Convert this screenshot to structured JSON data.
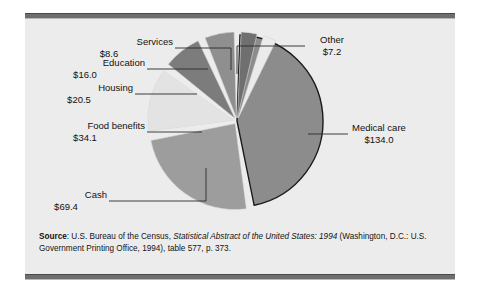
{
  "figure": {
    "background": "#ececec",
    "rule_color": "#6e6e6e"
  },
  "source": {
    "label": "Source",
    "colon": ":",
    "part1": " U.S. Bureau of the Census, ",
    "italic": "Statistical Abstract of the United States: 1994",
    "part2": " (Washington, D.C.: U.S. Government Printing Office, 1994), table 577, p. 373."
  },
  "chart_data": {
    "type": "pie",
    "title": "",
    "units": "billions of dollars",
    "total": 289.8,
    "legend": "none",
    "labels": [
      "Medical care",
      "Cash",
      "Food benefits",
      "Housing",
      "Education",
      "Services",
      "Other"
    ],
    "values": [
      134.0,
      69.4,
      34.1,
      20.5,
      16.0,
      8.6,
      7.2
    ],
    "value_labels": [
      "$134.0",
      "$69.4",
      "$34.1",
      "$20.5",
      "$16.0",
      "$8.6",
      "$7.2"
    ],
    "colors": [
      "#8c8c8c",
      "#9d9d9d",
      "#e3e3e3",
      "#7c7c7c",
      "#8f8f8f",
      "#6f6f6f",
      "#ebebeb"
    ],
    "slices": [
      {
        "name": "Medical care",
        "value": 134.0,
        "value_label": "$134.0",
        "color": "#8c8c8c",
        "start_deg": 2,
        "end_deg": 168.5
      },
      {
        "name": "Cash",
        "value": 69.4,
        "value_label": "$69.4",
        "color": "#9d9d9d",
        "start_deg": 172.5,
        "end_deg": 258.7
      },
      {
        "name": "Food benefits",
        "value": 34.1,
        "value_label": "$34.1",
        "color": "#e3e3e3",
        "start_deg": 262.7,
        "end_deg": 305.1
      },
      {
        "name": "Housing",
        "value": 20.5,
        "value_label": "$20.5",
        "color": "#7c7c7c",
        "start_deg": 309.1,
        "end_deg": 334.6
      },
      {
        "name": "Education",
        "value": 16.0,
        "value_label": "$16.0",
        "color": "#8f8f8f",
        "start_deg": 338.6,
        "end_deg": 358.5
      },
      {
        "name": "Services",
        "value": 8.6,
        "value_label": "$8.6",
        "color": "#6f6f6f",
        "start_deg": 362.5,
        "end_deg": 373.2
      },
      {
        "name": "Other",
        "value": 7.2,
        "value_label": "$7.2",
        "color": "#ebebeb",
        "start_deg": 377.2,
        "end_deg": 386.1
      }
    ]
  }
}
